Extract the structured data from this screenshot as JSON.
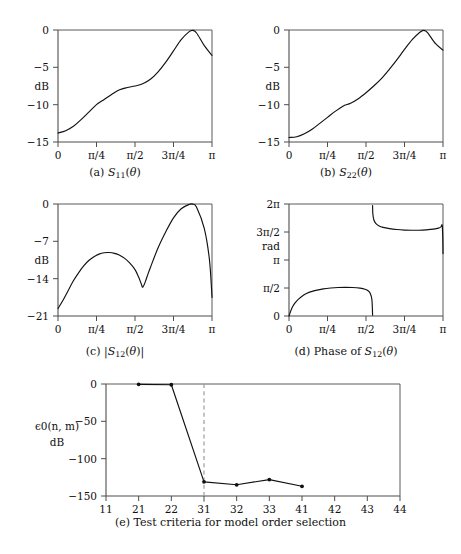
{
  "figure": {
    "title": "",
    "background": "#ffffff",
    "curve_color": "#111111",
    "axis_color": "#4d4d4d",
    "dash_color": "#9d9d9d"
  },
  "panels": [
    {
      "id": "a",
      "caption_prefix": "(a)",
      "caption_symbol": "S11(θ)",
      "ylabel": "dB",
      "xticklabels": [
        "0",
        "π/4",
        "π/2",
        "3π/4",
        "π"
      ],
      "yticklabels": [
        "0",
        "−5",
        "−10",
        "−15"
      ]
    },
    {
      "id": "b",
      "caption_prefix": "(b)",
      "caption_symbol": "S22(θ)",
      "ylabel": "dB",
      "xticklabels": [
        "0",
        "π/4",
        "π/2",
        "3π/4",
        "π"
      ],
      "yticklabels": [
        "0",
        "−5",
        "−10",
        "−15"
      ]
    },
    {
      "id": "c",
      "caption_prefix": "(c)",
      "caption_symbol": "|S12(θ)|",
      "ylabel": "dB",
      "xticklabels": [
        "0",
        "π/4",
        "π/2",
        "3π/4",
        "π"
      ],
      "yticklabels": [
        "0",
        "−7",
        "−14",
        "−21"
      ]
    },
    {
      "id": "d",
      "caption_prefix": "(d)",
      "caption_symbol": "Phase of S12(θ)",
      "ylabel": "rad",
      "xticklabels": [
        "0",
        "π/4",
        "π/2",
        "3π/4",
        "π"
      ],
      "yticklabels": [
        "2π",
        "3π/2",
        "π",
        "π/2",
        "0"
      ]
    },
    {
      "id": "e",
      "caption_prefix": "(e)",
      "caption_symbol": "Test criteria for model order selection",
      "ylabel_main": "ϵ0(n, m)",
      "ylabel_unit": "dB",
      "xticklabels": [
        "11",
        "21",
        "22",
        "31",
        "32",
        "33",
        "41",
        "42",
        "43",
        "44"
      ],
      "yticklabels": [
        "0",
        "−50",
        "−100",
        "−150"
      ]
    }
  ],
  "chart_data": [
    {
      "type": "line",
      "panel": "a",
      "title": "(a) S11(θ)",
      "xlabel": "θ",
      "ylabel": "dB",
      "xlim": [
        0,
        3.14159
      ],
      "ylim": [
        -15.5,
        0.6
      ],
      "xticks": [
        0,
        0.7854,
        1.5708,
        2.35619,
        3.14159
      ],
      "xticklabels": [
        "0",
        "π/4",
        "π/2",
        "3π/4",
        "π"
      ],
      "yticks": [
        0,
        -5,
        -10,
        -15
      ],
      "yticklabels": [
        "0",
        "−5",
        "−10",
        "−15"
      ],
      "grid": false,
      "x": [
        0.0,
        0.157,
        0.314,
        0.471,
        0.628,
        0.785,
        0.942,
        1.1,
        1.257,
        1.414,
        1.571,
        1.728,
        1.885,
        2.042,
        2.199,
        2.356,
        2.513,
        2.67,
        2.749,
        2.827,
        2.985,
        3.142
      ],
      "y": [
        -13.8,
        -13.5,
        -12.9,
        -12.0,
        -11.0,
        -10.0,
        -9.3,
        -8.6,
        -8.0,
        -7.7,
        -7.5,
        -7.2,
        -6.6,
        -5.6,
        -4.3,
        -2.8,
        -1.3,
        -0.25,
        -0.05,
        -0.4,
        -2.1,
        -3.4
      ]
    },
    {
      "type": "line",
      "panel": "b",
      "title": "(b) S22(θ)",
      "xlabel": "θ",
      "ylabel": "dB",
      "xlim": [
        0,
        3.14159
      ],
      "ylim": [
        -15.5,
        0.6
      ],
      "xticks": [
        0,
        0.7854,
        1.5708,
        2.35619,
        3.14159
      ],
      "xticklabels": [
        "0",
        "π/4",
        "π/2",
        "3π/4",
        "π"
      ],
      "yticks": [
        0,
        -5,
        -10,
        -15
      ],
      "yticklabels": [
        "0",
        "−5",
        "−10",
        "−15"
      ],
      "grid": false,
      "x": [
        0.0,
        0.157,
        0.314,
        0.471,
        0.628,
        0.785,
        0.942,
        1.1,
        1.257,
        1.414,
        1.571,
        1.728,
        1.885,
        2.042,
        2.199,
        2.356,
        2.513,
        2.67,
        2.749,
        2.827,
        2.985,
        3.142
      ],
      "y": [
        -14.4,
        -14.3,
        -13.9,
        -13.3,
        -12.5,
        -11.7,
        -10.9,
        -10.2,
        -9.8,
        -9.2,
        -8.4,
        -7.5,
        -6.5,
        -5.3,
        -4.0,
        -2.6,
        -1.3,
        -0.3,
        -0.05,
        -0.35,
        -1.8,
        -2.7
      ]
    },
    {
      "type": "line",
      "panel": "c",
      "title": "(c) |S12(θ)|",
      "xlabel": "θ",
      "ylabel": "dB",
      "xlim": [
        0,
        3.14159
      ],
      "ylim": [
        -21.8,
        0.6
      ],
      "xticks": [
        0,
        0.7854,
        1.5708,
        2.35619,
        3.14159
      ],
      "xticklabels": [
        "0",
        "π/4",
        "π/2",
        "3π/4",
        "π"
      ],
      "yticks": [
        0,
        -7,
        -14,
        -21
      ],
      "yticklabels": [
        "0",
        "−7",
        "−14",
        "−21"
      ],
      "grid": false,
      "x": [
        0.0,
        0.105,
        0.209,
        0.314,
        0.419,
        0.524,
        0.628,
        0.733,
        0.838,
        0.942,
        1.047,
        1.152,
        1.257,
        1.361,
        1.466,
        1.571,
        1.64,
        1.7,
        1.728,
        1.78,
        1.833,
        1.885,
        2.042,
        2.199,
        2.356,
        2.513,
        2.67,
        2.749,
        2.827,
        2.985,
        3.09,
        3.142
      ],
      "y": [
        -19.6,
        -18.0,
        -16.2,
        -14.4,
        -12.9,
        -11.6,
        -10.6,
        -9.9,
        -9.4,
        -9.15,
        -9.1,
        -9.25,
        -9.6,
        -10.2,
        -11.1,
        -12.3,
        -13.6,
        -15.0,
        -15.6,
        -14.6,
        -13.2,
        -11.9,
        -8.2,
        -5.2,
        -2.6,
        -0.9,
        -0.1,
        -0.02,
        -0.6,
        -4.6,
        -10.5,
        -17.5
      ]
    },
    {
      "type": "line",
      "panel": "d",
      "title": "(d) Phase of S12(θ)",
      "xlabel": "θ",
      "ylabel": "rad",
      "xlim": [
        0,
        3.14159
      ],
      "ylim": [
        0,
        6.2832
      ],
      "xticks": [
        0,
        0.7854,
        1.5708,
        2.35619,
        3.14159
      ],
      "xticklabels": [
        "0",
        "π/4",
        "π/2",
        "3π/4",
        "π"
      ],
      "yticks": [
        0,
        1.5708,
        3.14159,
        4.71239,
        6.28319
      ],
      "yticklabels": [
        "0",
        "π/2",
        "π",
        "3π/2",
        "2π"
      ],
      "grid": false,
      "branch1_x": [
        0.0,
        0.06,
        0.12,
        0.2,
        0.3,
        0.42,
        0.55,
        0.7,
        0.85,
        1.0,
        1.15,
        1.3,
        1.45,
        1.55,
        1.62,
        1.66,
        1.69,
        1.7,
        1.705
      ],
      "branch1_y": [
        0.0,
        0.45,
        0.72,
        0.96,
        1.18,
        1.34,
        1.44,
        1.52,
        1.57,
        1.6,
        1.61,
        1.6,
        1.56,
        1.5,
        1.4,
        1.25,
        0.95,
        0.5,
        0.04
      ],
      "branch2_x": [
        1.705,
        1.71,
        1.73,
        1.77,
        1.83,
        1.92,
        2.05,
        2.2,
        2.35,
        2.5,
        2.65,
        2.8,
        2.95,
        3.05,
        3.1,
        3.125,
        3.138,
        3.142
      ],
      "branch2_y": [
        6.2,
        5.75,
        5.4,
        5.2,
        5.07,
        4.97,
        4.9,
        4.85,
        4.82,
        4.81,
        4.81,
        4.83,
        4.87,
        4.93,
        5.0,
        5.08,
        4.3,
        3.5
      ]
    },
    {
      "type": "line",
      "panel": "e",
      "title": "(e) Test criteria for model order selection",
      "xlabel": "",
      "ylabel": "ϵ0(n, m) dB",
      "xlim": [
        0,
        9
      ],
      "ylim": [
        -155,
        5
      ],
      "xticks": [
        0,
        1,
        2,
        3,
        4,
        5,
        6,
        7,
        8,
        9
      ],
      "xticklabels": [
        "11",
        "21",
        "22",
        "31",
        "32",
        "33",
        "41",
        "42",
        "43",
        "44"
      ],
      "yticks": [
        0,
        -50,
        -100,
        -150
      ],
      "yticklabels": [
        "0",
        "−50",
        "−100",
        "−150"
      ],
      "grid": false,
      "marker": "dot",
      "dashed_vline_at": "31",
      "categories": [
        "21",
        "22",
        "31",
        "32",
        "33",
        "41"
      ],
      "values": [
        -0.5,
        -1.0,
        -131.0,
        -135.0,
        -128.0,
        -137.0
      ]
    }
  ]
}
